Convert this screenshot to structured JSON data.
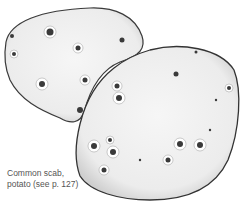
{
  "figure": {
    "caption": {
      "line1": "Common scab,",
      "line2": "potato (see p. 127)"
    },
    "colors": {
      "outline": "#333333",
      "skin": "#f2f2f2",
      "lesion": "#3a3a3a",
      "caption": "#555555"
    }
  }
}
